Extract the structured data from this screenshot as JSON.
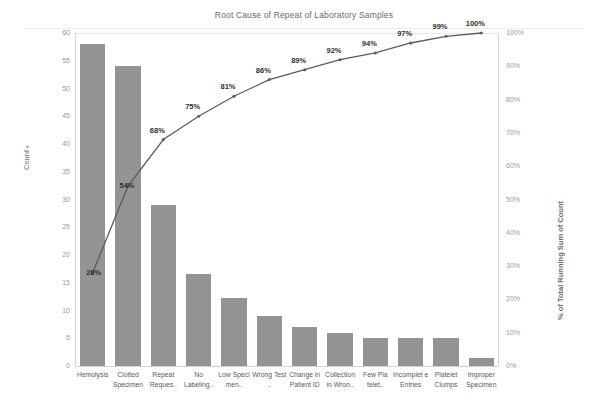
{
  "chart_data": {
    "type": "bar",
    "title": "Root Cause of Repeat of Laboratory Samples",
    "categories": [
      "Hemolysis",
      "Clotted Specimen",
      "Repeat Reques..",
      "No Labeling..",
      "Low Speci men..",
      "Wrong Test ..",
      "Change in Patient ID",
      "Collection in Wron..",
      "Few Pla telet..",
      "Incomplet e Entries",
      "Platelet Clumps",
      "Improper Specimen"
    ],
    "series": [
      {
        "name": "Count",
        "type": "bar",
        "values": [
          58,
          54,
          29,
          16.5,
          12.3,
          9.1,
          7,
          6,
          5,
          5,
          5,
          1.5
        ]
      },
      {
        "name": "% of Total Running Sum of Count",
        "type": "line",
        "values": [
          28,
          54,
          68,
          75,
          81,
          86,
          89,
          92,
          94,
          97,
          99,
          100
        ],
        "labels": [
          "28%",
          "54%",
          "68%",
          "75%",
          "81%",
          "86%",
          "89%",
          "92%",
          "94%",
          "97%",
          "99%",
          "100%"
        ]
      }
    ],
    "xlabel": "",
    "ylabel": "Count",
    "y2label": "% of Total Running Sum of Count",
    "ylim": [
      0,
      60
    ],
    "y2lim": [
      0,
      100
    ],
    "left_ticks": [
      "60",
      "55",
      "50",
      "45",
      "40",
      "35",
      "30",
      "25",
      "20",
      "15",
      "10",
      "5",
      "0"
    ],
    "left_tick_values": [
      60,
      55,
      50,
      45,
      40,
      35,
      30,
      25,
      20,
      15,
      10,
      5,
      0
    ],
    "right_ticks": [
      "100%",
      "90%",
      "80%",
      "70%",
      "60%",
      "50%",
      "40%",
      "30%",
      "20%",
      "10%",
      "0%"
    ],
    "right_tick_values": [
      100,
      90,
      80,
      70,
      60,
      50,
      40,
      30,
      20,
      10,
      0
    ],
    "grid": false,
    "legend": "none",
    "bar_color": "#949494",
    "line_color": "#5c5c5c",
    "sort_indicator": "descending"
  }
}
